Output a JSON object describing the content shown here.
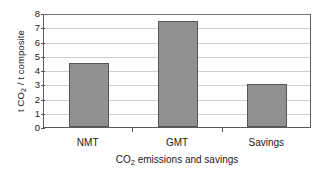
{
  "chart_data": {
    "type": "bar",
    "title": "",
    "categories": [
      "NMT",
      "GMT",
      "Savings"
    ],
    "values": [
      4.5,
      7.45,
      3.0
    ],
    "series": [
      {
        "name": "CO2 emissions and savings",
        "values": [
          4.5,
          7.45,
          3.0
        ]
      }
    ],
    "xlabel": "CO2 emissions and savings",
    "xlabel_parts": {
      "prefix": "CO",
      "subscript": "2",
      "suffix": " emissions and savings"
    },
    "ylabel": "t CO2 / t composite",
    "ylabel_parts": {
      "prefix": "t CO",
      "subscript": "2",
      "suffix": " / t composite"
    },
    "ylim": [
      0,
      8
    ],
    "ytick_values": [
      0,
      1,
      2,
      3,
      4,
      5,
      6,
      7,
      8
    ],
    "ytick_labels": [
      "0",
      "1",
      "2",
      "3",
      "4",
      "5",
      "6",
      "7",
      "8"
    ],
    "grid": true,
    "grid_axis": "y",
    "legend": false,
    "legend_position": "none",
    "bar_color": "#919191",
    "bar_edge_color": "#565656",
    "grid_color": "#cfcfcf",
    "axis_color": "#5a5a5a",
    "background_color": "#ffffff"
  }
}
